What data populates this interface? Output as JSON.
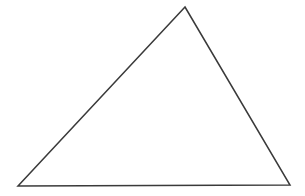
{
  "figure": {
    "kind": "line-drawing",
    "width": 305,
    "height": 196,
    "background_color": "#ffffff",
    "has_text_labels": false,
    "label_text": ""
  },
  "style": {
    "stroke_color": "#3a3a3a",
    "stroke_width": 1.5,
    "fill_color": "none"
  },
  "shape": {
    "name": "triangle",
    "type": "scalene",
    "vertices": [
      {
        "name": "apex",
        "x": 185,
        "y": 7
      },
      {
        "name": "bottom-right",
        "x": 290,
        "y": 185
      },
      {
        "name": "bottom-left",
        "x": 18,
        "y": 186
      }
    ],
    "points_attr": "185,7 290,185 18,186",
    "edges": [
      {
        "name": "left-edge",
        "from": "bottom-left",
        "to": "apex"
      },
      {
        "name": "right-edge",
        "from": "apex",
        "to": "bottom-right"
      },
      {
        "name": "base-edge",
        "from": "bottom-right",
        "to": "bottom-left"
      }
    ]
  }
}
